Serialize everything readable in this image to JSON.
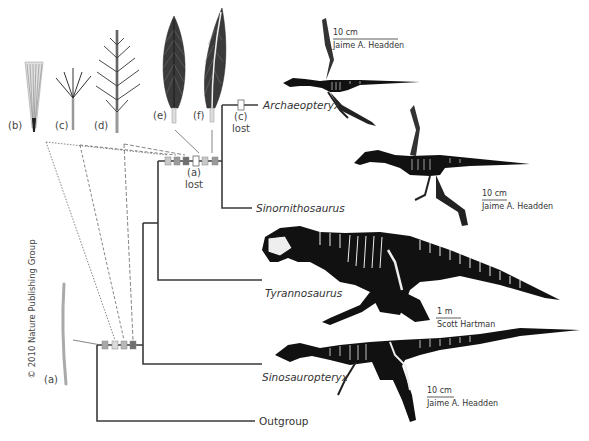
{
  "figure": {
    "copyright": "© 2010 Nature Publishing Group",
    "feather_types": [
      {
        "id": "a",
        "label": "(a)"
      },
      {
        "id": "b",
        "label": "(b)"
      },
      {
        "id": "c",
        "label": "(c)"
      },
      {
        "id": "d",
        "label": "(d)"
      },
      {
        "id": "e",
        "label": "(e)"
      },
      {
        "id": "f",
        "label": "(f)"
      }
    ],
    "node_annotations": {
      "paraves_loss": {
        "feather": "(a)",
        "note": "lost"
      },
      "archaeopteryx_loss": {
        "feather": "(c)",
        "note": "lost"
      }
    },
    "taxa": [
      {
        "name": "Archaeopteryx",
        "scale": "10 cm",
        "credit": "Jaime A. Headden"
      },
      {
        "name": "Sinornithosaurus",
        "scale": "10 cm",
        "credit": "Jaime A. Headden"
      },
      {
        "name": "Tyrannosaurus",
        "scale": "1 m",
        "credit": "Scott Hartman"
      },
      {
        "name": "Sinosauropteryx",
        "scale": "10 cm",
        "credit": "Jaime A. Headden"
      },
      {
        "name": "Outgroup"
      }
    ],
    "colors": {
      "branch": "#3a3a3a",
      "box_light": "#c9c9c9",
      "box_mid": "#a8a8a8",
      "box_dark": "#6e6e6e",
      "box_open": "#ffffff",
      "skeleton": "#111111"
    }
  }
}
